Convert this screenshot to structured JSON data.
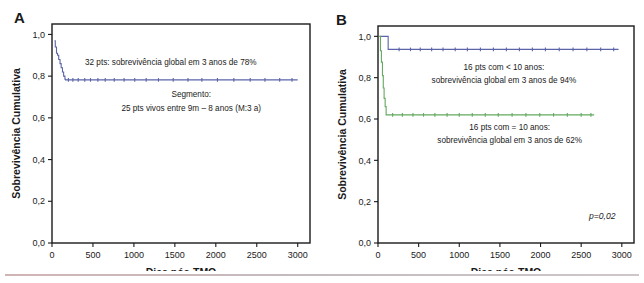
{
  "figure": {
    "title_letters": {
      "a": "A",
      "b": "B"
    },
    "bottom_rule": true
  },
  "chart_data": [
    {
      "id": "panel-a",
      "type": "line",
      "panel_label": "A",
      "title": "",
      "xlabel": "Dias pós-TMO",
      "ylabel": "Sobrevivência Cumulativa",
      "xlim": [
        0,
        3150
      ],
      "ylim": [
        0,
        1.05
      ],
      "xticks": [
        0,
        500,
        1000,
        1500,
        2000,
        2500,
        3000
      ],
      "xticklabels": [
        "0",
        "500",
        "1000",
        "1500",
        "2000",
        "2500",
        "3000"
      ],
      "yticks": [
        0.0,
        0.2,
        0.4,
        0.6,
        0.8,
        1.0
      ],
      "yticklabels": [
        "0,0",
        "0,2",
        "0,4",
        "0,6",
        "0,8",
        "1,0"
      ],
      "grid": false,
      "legend": "none",
      "series": [
        {
          "name": "Sobrevida global (32 pts)",
          "color": "#5b64a8",
          "x": [
            30,
            40,
            45,
            55,
            60,
            68,
            75,
            82,
            90,
            98,
            105,
            112,
            120,
            128,
            135,
            142,
            150,
            158,
            165,
            3000
          ],
          "y": [
            0.97,
            0.94,
            0.94,
            0.91,
            0.91,
            0.9,
            0.9,
            0.88,
            0.88,
            0.86,
            0.86,
            0.84,
            0.84,
            0.82,
            0.82,
            0.8,
            0.8,
            0.785,
            0.782,
            0.782
          ],
          "censored_x": [
            200,
            255,
            320,
            400,
            470,
            560,
            650,
            760,
            880,
            1010,
            1150,
            1300,
            1480,
            1660,
            1830,
            2020,
            2220,
            2420,
            2600,
            2780,
            2930
          ],
          "censored_y": 0.782
        }
      ],
      "annotations": [
        {
          "name": "survival-note",
          "text": "32 pts: sobrevivência global em 3 anos de 78%",
          "x": 1450,
          "y": 0.855
        },
        {
          "name": "followup-heading",
          "text": "Segmento:",
          "x": 1700,
          "y": 0.7
        },
        {
          "name": "followup-detail",
          "text": "25 pts vivos entre 9m – 8 anos (M:3 a)",
          "x": 1700,
          "y": 0.635
        }
      ]
    },
    {
      "id": "panel-b",
      "type": "line",
      "panel_label": "B",
      "title": "",
      "xlabel": "Dias pós-TMO",
      "ylabel": "Sobrevivência Cumulativa",
      "xlim": [
        0,
        3150
      ],
      "ylim": [
        0,
        1.05
      ],
      "xticks": [
        0,
        500,
        1000,
        1500,
        2000,
        2500,
        3000
      ],
      "xticklabels": [
        "0",
        "500",
        "1000",
        "1500",
        "2000",
        "2500",
        "3000"
      ],
      "yticks": [
        0.0,
        0.2,
        0.4,
        0.6,
        0.8,
        1.0
      ],
      "yticklabels": [
        "0,0",
        "0,2",
        "0,4",
        "0,6",
        "0,8",
        "1,0"
      ],
      "grid": false,
      "legend": "none",
      "series": [
        {
          "name": "16 pts com < 10 anos",
          "color": "#5b64a8",
          "x": [
            20,
            120,
            125,
            2960
          ],
          "y": [
            1.0,
            1.0,
            0.937,
            0.937
          ],
          "censored_x": [
            260,
            400,
            520,
            660,
            800,
            950,
            1100,
            1260,
            1420,
            1580,
            1740,
            1900,
            2060,
            2230,
            2400,
            2570,
            2740,
            2900
          ],
          "censored_y": 0.937
        },
        {
          "name": "16 pts com = 10 anos",
          "color": "#63a95f",
          "x": [
            15,
            28,
            30,
            40,
            42,
            52,
            55,
            62,
            65,
            72,
            75,
            82,
            88,
            95,
            100,
            2660
          ],
          "y": [
            1.0,
            1.0,
            0.93,
            0.93,
            0.875,
            0.875,
            0.81,
            0.81,
            0.75,
            0.75,
            0.7,
            0.7,
            0.66,
            0.66,
            0.62,
            0.62
          ],
          "censored_x": [
            180,
            300,
            430,
            560,
            700,
            850,
            1000,
            1160,
            1320,
            1480,
            1650,
            1820,
            1990,
            2160,
            2330,
            2500,
            2620
          ],
          "censored_y": 0.62
        }
      ],
      "annotations": [
        {
          "name": "group-young-line1",
          "text": "16 pts com < 10 anos:",
          "x": 1550,
          "y": 0.835
        },
        {
          "name": "group-young-line2",
          "text": "sobrevivência global em 3 anos de 94%",
          "x": 1550,
          "y": 0.775
        },
        {
          "name": "group-old-line1",
          "text": "16 pts com = 10 anos:",
          "x": 1620,
          "y": 0.545
        },
        {
          "name": "group-old-line2",
          "text": "sobrevivência global em 3 anos de 62%",
          "x": 1620,
          "y": 0.485
        },
        {
          "name": "p-value",
          "text": "p=0,02",
          "x": 2760,
          "y": 0.115,
          "italic": true
        }
      ]
    }
  ],
  "colors": {
    "axis": "#1a1a1a",
    "text": "#1a1a1a",
    "series_blue": "#5b64a8",
    "series_green": "#63a95f",
    "background": "#ffffff"
  }
}
